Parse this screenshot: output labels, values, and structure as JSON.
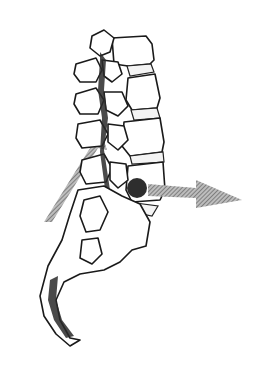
{
  "figure": {
    "background_color": "#ffffff",
    "line_color": "#1a1a1a",
    "elements": {
      "vertebrae_count": 5,
      "sacrum": true,
      "coccyx": true,
      "posterior_arrow": {
        "direction": "up-right",
        "color": "#8a8a8a"
      },
      "anterior_arrow": {
        "direction": "right",
        "color": "#6e6e6e"
      },
      "lesion_dot": {
        "color": "#2e2e2e"
      },
      "endplate_dark_band": {
        "color": "#111111"
      }
    }
  }
}
